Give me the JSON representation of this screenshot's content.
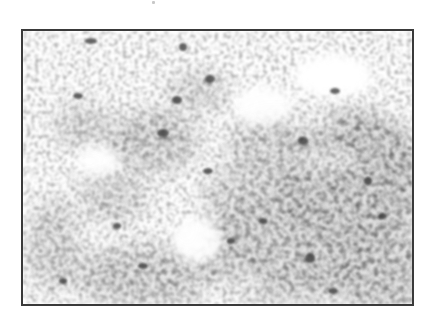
{
  "figure": {
    "type": "grayscale micrograph",
    "frame": {
      "border_color": "#3a3a3a",
      "background": "#ffffff"
    },
    "texture": {
      "stain_color_dark": "#3c3c3c",
      "stain_color_mid": "#7a7a7a",
      "stain_color_light": "#b4b4b4"
    }
  }
}
